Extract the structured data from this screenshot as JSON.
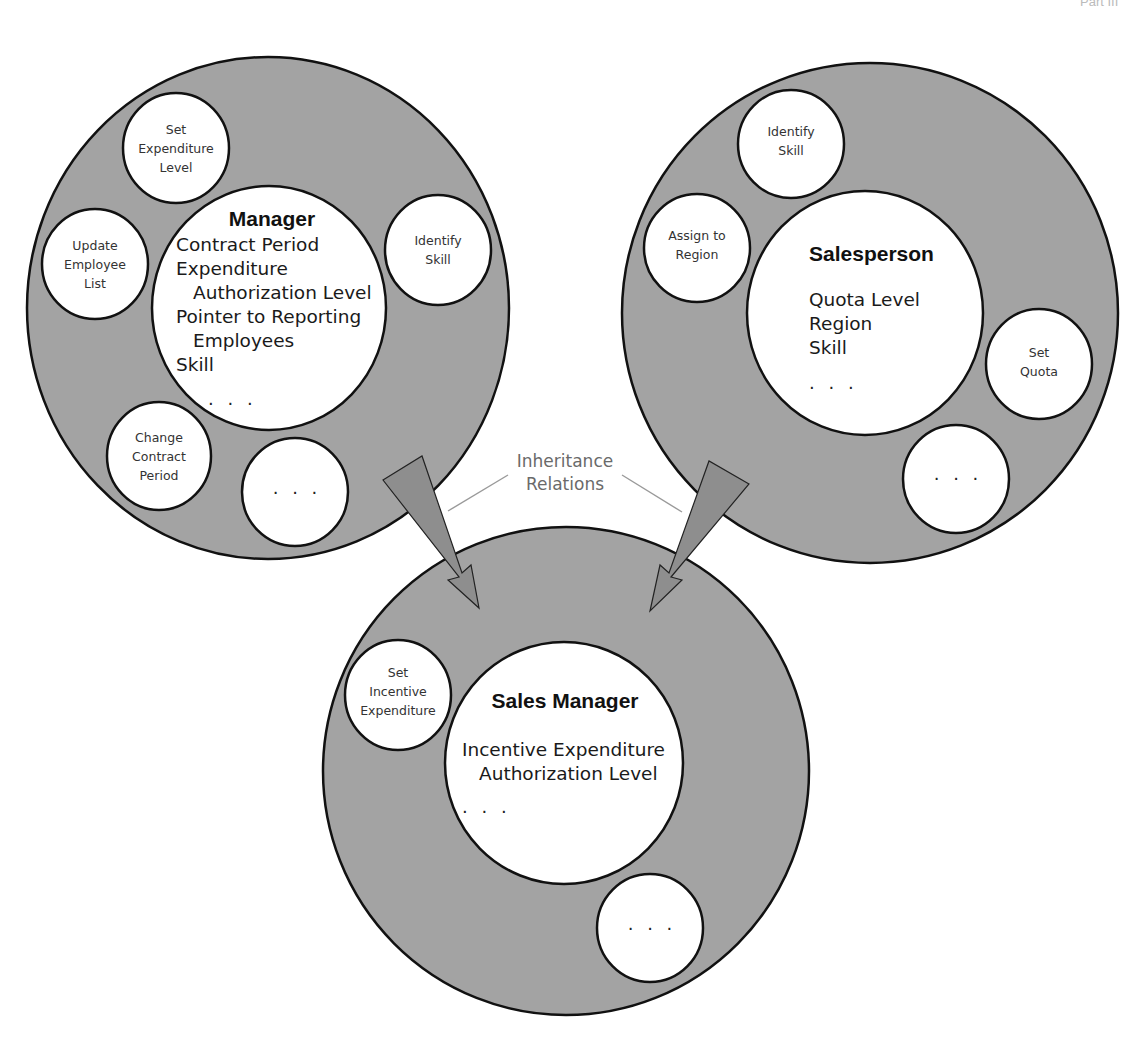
{
  "figure": {
    "header_fragment": "Part III"
  },
  "classes": {
    "manager": {
      "title": "Manager",
      "attributes": [
        "Contract Period",
        "Expenditure",
        "Authorization Level",
        "Pointer to Reporting",
        "Employees",
        "Skill"
      ],
      "ellipsis": ". . .",
      "methods": {
        "set_expenditure": [
          "Set",
          "Expenditure",
          "Level"
        ],
        "update_employee": [
          "Update",
          "Employee",
          "List"
        ],
        "identify_skill": [
          "Identify",
          "Skill"
        ],
        "change_contract": [
          "Change",
          "Contract",
          "Period"
        ],
        "more": ". . ."
      }
    },
    "salesperson": {
      "title": "Salesperson",
      "attributes": [
        "Quota Level",
        "Region",
        "Skill"
      ],
      "ellipsis": ". . .",
      "methods": {
        "identify_skill": [
          "Identify",
          "Skill"
        ],
        "assign_region": [
          "Assign to",
          "Region"
        ],
        "set_quota": [
          "Set",
          "Quota"
        ],
        "more": ". . ."
      }
    },
    "sales_manager": {
      "title": "Sales Manager",
      "attributes": [
        "Incentive Expenditure",
        "Authorization Level"
      ],
      "ellipsis": ". . .",
      "methods": {
        "set_incentive": [
          "Set",
          "Incentive",
          "Expenditure"
        ],
        "more": ". . ."
      }
    }
  },
  "inheritance_label": [
    "Inheritance",
    "Relations"
  ],
  "colors": {
    "ring_fill": "#a3a3a3",
    "circle_fill": "#ffffff",
    "outline": "#111111",
    "arrow_fill": "#8e8e8e",
    "label_text": "#6a6a6a"
  }
}
